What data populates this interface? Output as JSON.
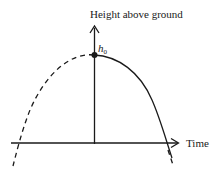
{
  "diagram": {
    "y_axis_label": "Height above ground",
    "x_axis_label": "Time",
    "point_label": {
      "main": "h",
      "subscript": "0"
    },
    "curves": [
      {
        "name": "projected-past-trajectory",
        "style": "dashed"
      },
      {
        "name": "actual-trajectory",
        "style": "solid"
      }
    ],
    "colors": {
      "stroke": "#1a1a1a",
      "background": "#ffffff"
    }
  }
}
